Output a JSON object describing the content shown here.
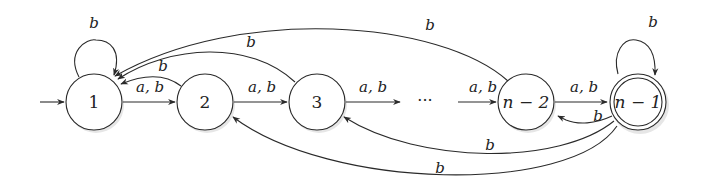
{
  "diagram": {
    "type": "finite-automaton",
    "nodes": [
      {
        "id": "1",
        "label": "1",
        "initial": true,
        "accepting": false
      },
      {
        "id": "2",
        "label": "2",
        "initial": false,
        "accepting": false
      },
      {
        "id": "3",
        "label": "3",
        "initial": false,
        "accepting": false
      },
      {
        "id": "n-2",
        "label": "n − 2",
        "initial": false,
        "accepting": false
      },
      {
        "id": "n-1",
        "label": "n − 1",
        "initial": false,
        "accepting": true
      }
    ],
    "ellipsis": "···",
    "edges": [
      {
        "from": "1",
        "to": "1",
        "label": "b"
      },
      {
        "from": "1",
        "to": "2",
        "label": "a, b"
      },
      {
        "from": "2",
        "to": "3",
        "label": "a, b"
      },
      {
        "from": "3",
        "to": "…",
        "label": "a, b"
      },
      {
        "from": "…",
        "to": "n-2",
        "label": "a, b"
      },
      {
        "from": "n-2",
        "to": "n-1",
        "label": "a, b"
      },
      {
        "from": "n-1",
        "to": "n-1",
        "label": "b"
      },
      {
        "from": "2",
        "to": "1",
        "label": "b"
      },
      {
        "from": "3",
        "to": "1",
        "label": "b"
      },
      {
        "from": "n-2",
        "to": "1",
        "label": "b"
      },
      {
        "from": "n-1",
        "to": "n-2",
        "label": "b"
      },
      {
        "from": "n-1",
        "to": "3",
        "label": "b"
      },
      {
        "from": "n-1",
        "to": "2",
        "label": "b"
      }
    ]
  }
}
